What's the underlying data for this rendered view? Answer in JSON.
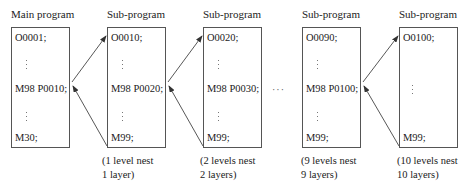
{
  "diagram": {
    "ellipsis": "···",
    "programs": [
      {
        "title": "Main program",
        "lines": {
          "first": "O0001;",
          "call": "M98 P0010;",
          "last": "M30;"
        },
        "caption": null
      },
      {
        "title": "Sub-program",
        "lines": {
          "first": "O0010;",
          "call": "M98 P0020;",
          "last": "M99;"
        },
        "caption": {
          "line1": "(1 level nest",
          "line2": "1 layer)"
        }
      },
      {
        "title": "Sub-program",
        "lines": {
          "first": "O0020;",
          "call": "M98 P0030;",
          "last": "M99;"
        },
        "caption": {
          "line1": "(2 levels nest",
          "line2": "2 layers)"
        }
      },
      {
        "title": "Sub-program",
        "lines": {
          "first": "O0090;",
          "call": "M98 P0100;",
          "last": "M99;"
        },
        "caption": {
          "line1": "(9 levels nest",
          "line2": "9 layers)"
        }
      },
      {
        "title": "Sub-program",
        "lines": {
          "first": "O0100;",
          "call": null,
          "last": "M99;"
        },
        "caption": {
          "line1": "(10 levels nest",
          "line2": "10 layers)"
        }
      }
    ],
    "colors": {
      "line": "#555555",
      "text": "#222222"
    }
  }
}
